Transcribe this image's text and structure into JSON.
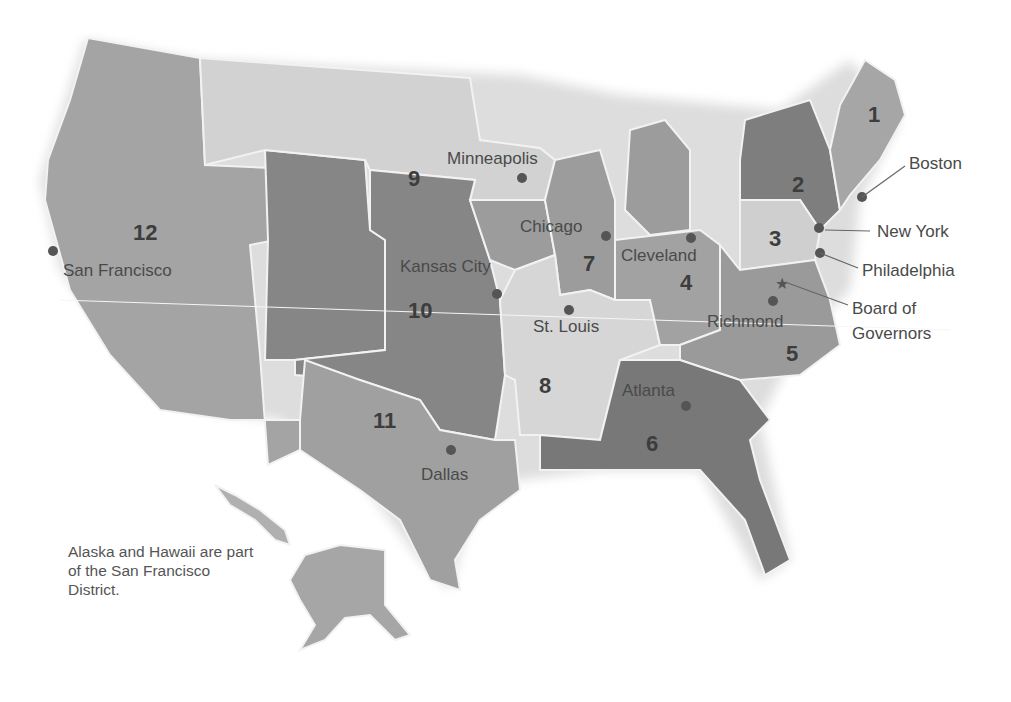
{
  "map": {
    "title": "Federal Reserve Districts",
    "districts": [
      {
        "number": "1",
        "city": "Boston"
      },
      {
        "number": "2",
        "city": "New York"
      },
      {
        "number": "3",
        "city": "Philadelphia"
      },
      {
        "number": "4",
        "city": "Cleveland"
      },
      {
        "number": "5",
        "city": "Richmond"
      },
      {
        "number": "6",
        "city": "Atlanta"
      },
      {
        "number": "7",
        "city": "Chicago"
      },
      {
        "number": "8",
        "city": "St. Louis"
      },
      {
        "number": "9",
        "city": "Minneapolis"
      },
      {
        "number": "10",
        "city": "Kansas City"
      },
      {
        "number": "11",
        "city": "Dallas"
      },
      {
        "number": "12",
        "city": "San Francisco"
      }
    ],
    "extra_labels": {
      "board": "Board of Governors",
      "board_line1": "Board of",
      "board_line2": "Governors"
    },
    "note": "Alaska and Hawaii are part of the San Francisco District.",
    "colors": {
      "light": "#d3d3d3",
      "mid": "#a8a8a8",
      "dark": "#8a8a8a",
      "darker": "#7a7a7a",
      "border": "#f2f2f2",
      "dot": "#555555"
    }
  }
}
